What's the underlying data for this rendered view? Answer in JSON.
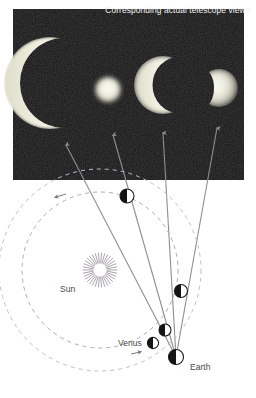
{
  "figure": {
    "background_color": "#ffffff"
  },
  "photo_panel": {
    "caption": "Corresponding actual telescope views",
    "background_color": "#0d0d0d",
    "caption_color": "#f2f2f2",
    "x": 13,
    "y": 9,
    "width": 231,
    "height": 171,
    "telescope_views": [
      {
        "name": "venus-thin-crescent-large",
        "phase": "thin crescent",
        "cx": 50,
        "cy": 83,
        "radius": 46,
        "illumination_pct": 8,
        "apparent_size": "largest"
      },
      {
        "name": "venus-full-small",
        "phase": "near full",
        "cx": 108,
        "cy": 90,
        "radius": 13,
        "illumination_pct": 96,
        "apparent_size": "smallest"
      },
      {
        "name": "venus-crescent-medium",
        "phase": "crescent",
        "cx": 163,
        "cy": 85,
        "radius": 29,
        "illumination_pct": 25,
        "apparent_size": "large"
      },
      {
        "name": "venus-gibbous-quarter",
        "phase": "quarter/gibbous",
        "cx": 219,
        "cy": 88,
        "radius": 19,
        "illumination_pct": 55,
        "apparent_size": "medium"
      }
    ]
  },
  "diagram": {
    "sun": {
      "label": "Sun",
      "cx": 100,
      "cy": 270,
      "ray_count": 34,
      "inner_radius": 7,
      "outer_radius": 17,
      "color": "#8c8c8c"
    },
    "orbits": [
      {
        "name": "venus-orbit",
        "cx": 100,
        "cy": 270,
        "rx": 78,
        "ry": 78,
        "style": "dashed",
        "color": "#b0a8b8"
      },
      {
        "name": "earth-orbit",
        "cx": 100,
        "cy": 270,
        "rx": 101,
        "ry": 101,
        "style": "dashed",
        "color": "#c3bcc8"
      }
    ],
    "earth": {
      "label": "Earth",
      "cx": 176,
      "cy": 357,
      "radius": 7.5,
      "lit_side": "left"
    },
    "venus_label": "Venus",
    "venus_positions": [
      {
        "name": "venus-position-1",
        "cx": 127,
        "cy": 196,
        "radius": 7.0,
        "phase": "thin crescent",
        "lit_side": "left"
      },
      {
        "name": "venus-position-2",
        "cx": 181,
        "cy": 291,
        "radius": 6.5,
        "phase": "near full",
        "lit_side": "left"
      },
      {
        "name": "venus-position-3",
        "cx": 165,
        "cy": 330,
        "radius": 6.0,
        "phase": "crescent",
        "lit_side": "left"
      },
      {
        "name": "venus-position-4",
        "cx": 153,
        "cy": 343,
        "radius": 5.5,
        "phase": "quarter",
        "lit_side": "left"
      }
    ],
    "sight_lines": [
      {
        "name": "sight-line-1",
        "from": "earth",
        "to": "venus-position-1",
        "arrow_tip": [
          66,
          145
        ]
      },
      {
        "name": "sight-line-2",
        "from": "earth",
        "to": "venus-position-2",
        "arrow_tip": [
          113,
          135
        ]
      },
      {
        "name": "sight-line-3",
        "from": "earth",
        "to": "venus-position-3",
        "arrow_tip": [
          163,
          133
        ]
      },
      {
        "name": "sight-line-4",
        "from": "earth",
        "to": "venus-position-4",
        "arrow_tip": [
          217,
          128
        ]
      }
    ],
    "orbit_direction_arrows": [
      {
        "name": "venus-orbit-direction-arrow",
        "x": 137,
        "y": 353,
        "heading": "counter-clockwise"
      },
      {
        "name": "earth-orbit-direction-arrow",
        "x": 61,
        "y": 195,
        "heading": "counter-clockwise"
      }
    ],
    "line_color": "#8a8a8a",
    "label_color": "#4a4a4a"
  }
}
